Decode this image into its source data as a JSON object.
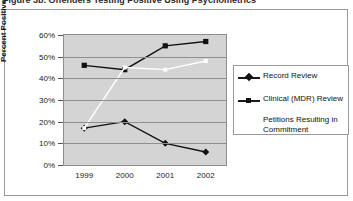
{
  "figure": {
    "caption": "Figure 3b. Offenders Testing Positive Using Psychometrics"
  },
  "legend": {
    "items": [
      {
        "label": "Record Review",
        "marker": "diamond",
        "color": "#111111"
      },
      {
        "label": "Clinical (MDR) Review",
        "marker": "square",
        "color": "#111111"
      },
      {
        "label": "Petitions Resulting in Commitment",
        "marker": "none",
        "color": "#ffffff"
      }
    ]
  },
  "chart_data": {
    "type": "line",
    "title": "",
    "xlabel": "",
    "ylabel": "Percent Positive",
    "categories": [
      "1999",
      "2000",
      "2001",
      "2002"
    ],
    "ylim": [
      0,
      60
    ],
    "yticks": [
      "0%",
      "10%",
      "20%",
      "30%",
      "40%",
      "50%",
      "60%"
    ],
    "ytick_values": [
      0,
      10,
      20,
      30,
      40,
      50,
      60
    ],
    "grid": true,
    "legend_position": "right",
    "series": [
      {
        "name": "Record Review",
        "marker": "diamond",
        "color": "#111111",
        "values": [
          17,
          20,
          10,
          6
        ]
      },
      {
        "name": "Clinical (MDR) Review",
        "marker": "square",
        "color": "#111111",
        "values": [
          46,
          44,
          55,
          57
        ]
      },
      {
        "name": "Petitions Resulting in Commitment",
        "marker": "none",
        "color": "#ffffff",
        "values": [
          17,
          45,
          44,
          48
        ]
      }
    ]
  }
}
